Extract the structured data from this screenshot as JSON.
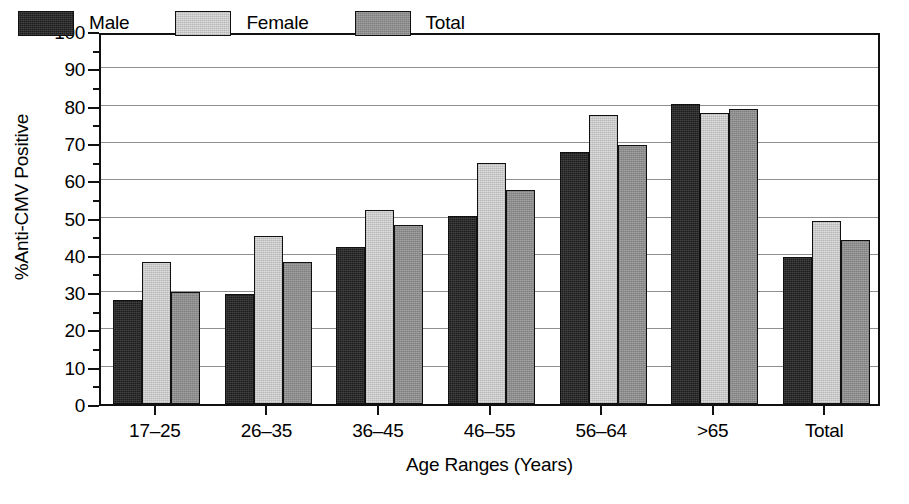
{
  "chart_data": {
    "type": "bar",
    "title": "",
    "xlabel": "Age Ranges (Years)",
    "ylabel": "%Anti-CMV Positive",
    "categories": [
      "17–25",
      "26–35",
      "36–45",
      "46–55",
      "56–64",
      ">65",
      "Total"
    ],
    "series": [
      {
        "name": "Male",
        "color": "#1c1c1c",
        "values": [
          28.0,
          29.5,
          42.0,
          50.5,
          67.5,
          80.5,
          39.5
        ]
      },
      {
        "name": "Female",
        "color": "#dedede",
        "values": [
          38.0,
          45.0,
          52.0,
          64.5,
          77.5,
          78.0,
          49.0
        ]
      },
      {
        "name": "Total",
        "color": "#8d8d8d",
        "values": [
          30.0,
          38.0,
          48.0,
          57.5,
          69.5,
          79.0,
          44.0
        ]
      }
    ],
    "ylim": [
      0,
      100
    ],
    "ytick_step": 10,
    "yticks": [
      0,
      10,
      20,
      30,
      40,
      50,
      60,
      70,
      80,
      90,
      100
    ],
    "ytick_labels": [
      "0",
      "10",
      "20",
      "30",
      "40",
      "50",
      "60",
      "70",
      "80",
      "90",
      "100"
    ],
    "yminor_step": 5,
    "grid": true,
    "grid_axis": "y",
    "legend_position": "top-left-inside",
    "background_color": "#ffffff",
    "axis_color": "#111111",
    "grid_color": "#8f8f8f"
  },
  "legend": {
    "entries": [
      {
        "label": "Male",
        "swatch": "swatch-male"
      },
      {
        "label": "Female",
        "swatch": "swatch-female"
      },
      {
        "label": "Total",
        "swatch": "swatch-total"
      }
    ]
  }
}
